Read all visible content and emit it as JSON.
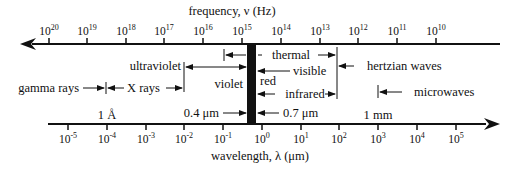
{
  "frequency_axis": {
    "title": "frequency, ν (Hz)",
    "direction": "left",
    "ticks": [
      {
        "base": "10",
        "exp": "20",
        "x": 49
      },
      {
        "base": "10",
        "exp": "19",
        "x": 87
      },
      {
        "base": "10",
        "exp": "18",
        "x": 126
      },
      {
        "base": "10",
        "exp": "17",
        "x": 164
      },
      {
        "base": "10",
        "exp": "16",
        "x": 203
      },
      {
        "base": "10",
        "exp": "15",
        "x": 242
      },
      {
        "base": "10",
        "exp": "14",
        "x": 281
      },
      {
        "base": "10",
        "exp": "13",
        "x": 320
      },
      {
        "base": "10",
        "exp": "12",
        "x": 358
      },
      {
        "base": "10",
        "exp": "11",
        "x": 397
      },
      {
        "base": "10",
        "exp": "10",
        "x": 436
      }
    ]
  },
  "wavelength_axis": {
    "title": "wavelength, λ (μm)",
    "direction": "right",
    "ticks": [
      {
        "base": "10",
        "exp": "-5",
        "x": 68
      },
      {
        "base": "10",
        "exp": "-4",
        "x": 107
      },
      {
        "base": "10",
        "exp": "-3",
        "x": 146
      },
      {
        "base": "10",
        "exp": "-2",
        "x": 184
      },
      {
        "base": "10",
        "exp": "-1",
        "x": 223
      },
      {
        "base": "10",
        "exp": "0",
        "x": 262
      },
      {
        "base": "10",
        "exp": "1",
        "x": 301
      },
      {
        "base": "10",
        "exp": "2",
        "x": 339
      },
      {
        "base": "10",
        "exp": "3",
        "x": 378
      },
      {
        "base": "10",
        "exp": "4",
        "x": 417
      },
      {
        "base": "10",
        "exp": "5",
        "x": 456
      }
    ]
  },
  "regions": {
    "thermal": "thermal",
    "ultraviolet": "ultraviolet",
    "visible": "visible",
    "violet": "violet",
    "red": "red",
    "infrared": "infrared",
    "hertzian_waves": "hertzian waves",
    "gamma_rays": "gamma rays",
    "x_rays": "X rays",
    "microwaves": "microwaves"
  },
  "markers": {
    "angstrom": "1 Å",
    "violet_edge": "0.4 μm",
    "red_edge": "0.7 μm",
    "millimeter": "1 mm"
  },
  "colors": {
    "ink": "#111111",
    "background": "#ffffff"
  }
}
